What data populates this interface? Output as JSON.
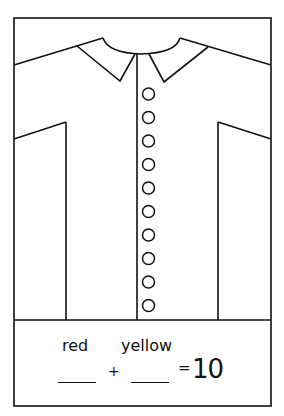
{
  "worksheet": {
    "shirt": {
      "button_count": 10,
      "stroke_color": "#111111",
      "background_color": "#ffffff"
    },
    "equation": {
      "label_1": "red",
      "label_2": "yellow",
      "blank_1": "",
      "blank_2": "",
      "plus": "+",
      "equals": "=",
      "total": "10"
    }
  }
}
